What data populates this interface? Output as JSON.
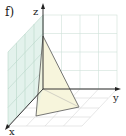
{
  "figure": {
    "panel_label": "f)",
    "axes": {
      "x_label": "x",
      "y_label": "y",
      "z_label": "z"
    },
    "colors": {
      "axis": "#222222",
      "grid": "#c8d8d0",
      "side_wall_fill": "#e3f2ec",
      "shape_edge": "#555555",
      "shape_fill": "#f7f5dc"
    }
  }
}
